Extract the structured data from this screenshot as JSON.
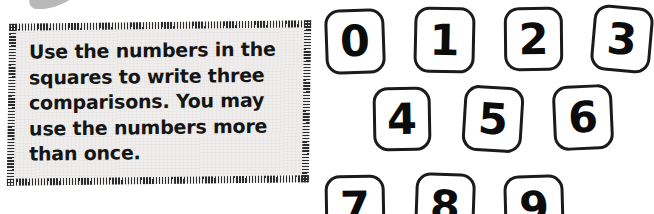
{
  "page": {
    "background_color": "#ffffff",
    "width": 654,
    "height": 214
  },
  "decor": {
    "corner_graphic_name": "cropped-dark-swoosh-graphic",
    "color": "#1a1a1a"
  },
  "instruction_box": {
    "name": "instruction-callout",
    "background_color": "#efeeec",
    "border_color": "#2b2b2b",
    "border_style": "ticked-dashed",
    "text": "Use the numbers in the\nsquares to write three\ncomparisons. You may\nuse the numbers more\nthan once.",
    "lines": [
      "Use the numbers in the",
      "squares to write three",
      "comparisons. You may",
      "use the numbers more",
      "than once."
    ]
  },
  "number_tiles": {
    "name": "number-tile-grid",
    "stroke_color": "#1b1b1b",
    "fill_color": "#ffffff",
    "digit_color": "#0c0c0c",
    "tiles": [
      {
        "label": "0",
        "x": 325,
        "y": 9,
        "w": 60,
        "h": 65,
        "rotate": -2.0
      },
      {
        "label": "1",
        "x": 414,
        "y": 7,
        "w": 61,
        "h": 66,
        "rotate": 1.2
      },
      {
        "label": "2",
        "x": 504,
        "y": 7,
        "w": 59,
        "h": 64,
        "rotate": -0.6
      },
      {
        "label": "3",
        "x": 592,
        "y": 6,
        "w": 60,
        "h": 66,
        "rotate": 5.0
      },
      {
        "label": "4",
        "x": 373,
        "y": 87,
        "w": 58,
        "h": 64,
        "rotate": -1.0
      },
      {
        "label": "5",
        "x": 463,
        "y": 86,
        "w": 60,
        "h": 66,
        "rotate": 3.5
      },
      {
        "label": "6",
        "x": 553,
        "y": 85,
        "w": 60,
        "h": 65,
        "rotate": -2.5
      },
      {
        "label": "7",
        "x": 325,
        "y": 175,
        "w": 60,
        "h": 65,
        "rotate": -1.0
      },
      {
        "label": "8",
        "x": 415,
        "y": 173,
        "w": 60,
        "h": 66,
        "rotate": 2.0
      },
      {
        "label": "9",
        "x": 504,
        "y": 175,
        "w": 60,
        "h": 65,
        "rotate": -1.5
      }
    ]
  }
}
